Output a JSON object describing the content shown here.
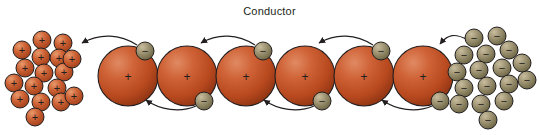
{
  "diagram": {
    "title": "Conductor",
    "canvas": {
      "width": 539,
      "height": 135,
      "background": "#ffffff"
    }
  },
  "colors": {
    "background": "#ffffff",
    "atom_fill_light": "#d9663f",
    "atom_fill_mid": "#c0502c",
    "atom_fill_dark": "#8f3415",
    "atom_outline": "#231f20",
    "electron_fill_light": "#b9ad8e",
    "electron_fill_dark": "#6f6648",
    "electron_outline": "#231f20",
    "proton_fill_light": "#e08a5a",
    "proton_fill_dark": "#a8401d",
    "proton_outline": "#231f20",
    "arrow": "#231f20",
    "sign_glyph": "#231f20",
    "title_text": "#231f20"
  },
  "labels": {
    "atom_core_sign": "+",
    "electron_sign": "−",
    "proton_sign": "+"
  },
  "conductor": {
    "name": "conductor-body",
    "atom_radius": 30,
    "atoms": [
      {
        "id": "atom-1",
        "cx": 128,
        "cy": 76,
        "core_label": "+"
      },
      {
        "id": "atom-2",
        "cx": 187,
        "cy": 76,
        "core_label": "+"
      },
      {
        "id": "atom-3",
        "cx": 246,
        "cy": 76,
        "core_label": "+"
      },
      {
        "id": "atom-4",
        "cx": 305,
        "cy": 76,
        "core_label": "+"
      },
      {
        "id": "atom-5",
        "cx": 364,
        "cy": 76,
        "core_label": "+"
      },
      {
        "id": "atom-6",
        "cx": 423,
        "cy": 76,
        "core_label": "+"
      }
    ]
  },
  "bound_electrons": {
    "name": "orbiting-electrons",
    "radius": 9,
    "items": [
      {
        "id": "electron-top-1",
        "cx": 145,
        "cy": 51,
        "label": "−"
      },
      {
        "id": "electron-bottom-2",
        "cx": 204,
        "cy": 101,
        "label": "−"
      },
      {
        "id": "electron-top-3",
        "cx": 263,
        "cy": 51,
        "label": "−"
      },
      {
        "id": "electron-bottom-4",
        "cx": 322,
        "cy": 101,
        "label": "−"
      },
      {
        "id": "electron-top-5",
        "cx": 381,
        "cy": 51,
        "label": "−"
      },
      {
        "id": "electron-bottom-6",
        "cx": 440,
        "cy": 101,
        "label": "−"
      }
    ]
  },
  "drift_arrows": {
    "name": "electron-drift-arrows",
    "direction": "right-to-left",
    "items": [
      {
        "id": "arrow-top-0",
        "path": "M 137 45 C 120 34, 100 33, 82 43",
        "tip": {
          "x": 82,
          "y": 43,
          "angle": 150
        }
      },
      {
        "id": "arrow-bottom-1",
        "path": "M 196 106 C 180 113, 160 110, 146 100",
        "tip": {
          "x": 146,
          "y": 100,
          "angle": 215
        }
      },
      {
        "id": "arrow-top-2",
        "path": "M 255 45 C 238 34, 218 33, 201 43",
        "tip": {
          "x": 201,
          "y": 43,
          "angle": 150
        }
      },
      {
        "id": "arrow-bottom-3",
        "path": "M 314 106 C 298 113, 278 110, 264 100",
        "tip": {
          "x": 264,
          "y": 100,
          "angle": 215
        }
      },
      {
        "id": "arrow-top-4",
        "path": "M 373 45 C 356 34, 336 33, 319 43",
        "tip": {
          "x": 319,
          "y": 43,
          "angle": 150
        }
      },
      {
        "id": "arrow-bottom-5",
        "path": "M 432 106 C 416 113, 396 110, 382 100",
        "tip": {
          "x": 382,
          "y": 100,
          "angle": 215
        }
      },
      {
        "id": "arrow-top-6",
        "path": "M 468 40 C 455 33, 448 34, 440 44",
        "tip": {
          "x": 440,
          "y": 44,
          "angle": 150
        }
      }
    ]
  },
  "positive_cluster": {
    "name": "positive-charge-cluster",
    "side": "left",
    "charge": "+",
    "count": 17,
    "radius": 9,
    "items": [
      {
        "cx": 42,
        "cy": 40
      },
      {
        "cx": 63,
        "cy": 43
      },
      {
        "cx": 22,
        "cy": 50
      },
      {
        "cx": 41,
        "cy": 57
      },
      {
        "cx": 59,
        "cy": 58
      },
      {
        "cx": 25,
        "cy": 68
      },
      {
        "cx": 44,
        "cy": 73
      },
      {
        "cx": 64,
        "cy": 72
      },
      {
        "cx": 14,
        "cy": 83
      },
      {
        "cx": 34,
        "cy": 86
      },
      {
        "cx": 57,
        "cy": 88
      },
      {
        "cx": 20,
        "cy": 99
      },
      {
        "cx": 41,
        "cy": 102
      },
      {
        "cx": 61,
        "cy": 102
      },
      {
        "cx": 74,
        "cy": 96
      },
      {
        "cx": 35,
        "cy": 117
      },
      {
        "cx": 72,
        "cy": 59
      }
    ]
  },
  "negative_cluster": {
    "name": "negative-charge-cluster",
    "side": "right",
    "charge": "−",
    "count": 17,
    "radius": 9,
    "items": [
      {
        "cx": 474,
        "cy": 38
      },
      {
        "cx": 497,
        "cy": 36
      },
      {
        "cx": 464,
        "cy": 55
      },
      {
        "cx": 486,
        "cy": 54
      },
      {
        "cx": 509,
        "cy": 50
      },
      {
        "cx": 457,
        "cy": 72
      },
      {
        "cx": 479,
        "cy": 70
      },
      {
        "cx": 502,
        "cy": 68
      },
      {
        "cx": 522,
        "cy": 63
      },
      {
        "cx": 464,
        "cy": 88
      },
      {
        "cx": 487,
        "cy": 86
      },
      {
        "cx": 509,
        "cy": 84
      },
      {
        "cx": 527,
        "cy": 80
      },
      {
        "cx": 459,
        "cy": 104
      },
      {
        "cx": 481,
        "cy": 104
      },
      {
        "cx": 504,
        "cy": 101
      },
      {
        "cx": 488,
        "cy": 120
      }
    ]
  }
}
